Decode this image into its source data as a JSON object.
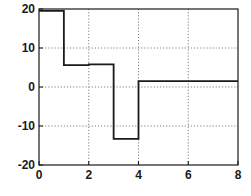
{
  "chart_data": {
    "type": "line",
    "subtype": "step-post",
    "title": "",
    "xlabel": "",
    "ylabel": "",
    "xlim": [
      0,
      8
    ],
    "ylim": [
      -20,
      20
    ],
    "xticks": [
      0,
      2,
      4,
      6,
      8
    ],
    "xtick_labels": [
      "0",
      "2",
      "4",
      "6",
      "8"
    ],
    "yticks": [
      -20,
      -10,
      0,
      10,
      20
    ],
    "ytick_labels": [
      "-20",
      "-10",
      "0",
      "10",
      "20"
    ],
    "grid": true,
    "grid_style": "dotted",
    "legend": null,
    "x_breaks": [
      0,
      1,
      2,
      3,
      4,
      8
    ],
    "values": [
      19.5,
      5.6,
      5.8,
      -13.3,
      1.5
    ],
    "series": [
      {
        "name": "step",
        "x": [
          0,
          1,
          1,
          2,
          2,
          3,
          3,
          4,
          4,
          8
        ],
        "y": [
          19.5,
          19.5,
          5.6,
          5.6,
          5.8,
          5.8,
          -13.3,
          -13.3,
          1.5,
          1.5
        ]
      }
    ],
    "line_color": "#1a1a1a",
    "line_width": 1.8,
    "grid_color": "#808080",
    "axes_color": "#1a1a1a",
    "background_color": "#ffffff"
  },
  "axes": {
    "left_px": 39,
    "right_px": 238,
    "top_px": 9,
    "bottom_px": 165
  }
}
